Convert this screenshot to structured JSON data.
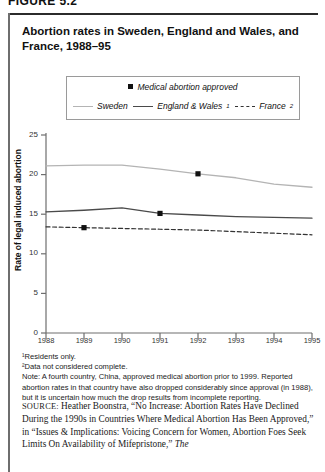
{
  "figure_tag": "FIGURE 5.2",
  "title": "Abortion rates in Sweden, England and Wales, and France, 1988–95",
  "legend": {
    "marker_label": "Medical abortion approved",
    "sweden_label": "Sweden",
    "england_label": "England & Wales",
    "england_sup": "1",
    "france_label": "France",
    "france_sup": "2"
  },
  "footnotes": {
    "fn1": "¹Residents only.",
    "fn2": "²Data not considered complete.",
    "note": "Note: A fourth country, China, approved medical abortion prior to 1999. Reported abortion rates in that country have also dropped considerably since approval (in 1988), but it is uncertain how much the drop results from incomplete reporting."
  },
  "source": {
    "label": "SOURCE:",
    "text": "Heather Boonstra, “No Increase: Abortion Rates Have Declined During the 1990s in Countries Where Medical Abortion Has Been Approved,” in “Issues & Implications: Voicing Concern for Women, Abortion Foes Seek Limits On Availability of Mifepristone,” ",
    "italic_tail": "The"
  },
  "colors": {
    "sweden": "#b4b4b4",
    "england": "#4a4a4a",
    "france": "#333333",
    "marker": "#111111",
    "axis": "#6e6e6e"
  },
  "chart_data": {
    "type": "line",
    "title": "Abortion rates in Sweden, England and Wales, and France, 1988–95",
    "xlabel": "",
    "ylabel": "Rate of legal induced abortion",
    "x": [
      1988,
      1989,
      1990,
      1991,
      1992,
      1993,
      1994,
      1995
    ],
    "categories": [
      "1988",
      "1989",
      "1990",
      "1991",
      "1992",
      "1993",
      "1994",
      "1995"
    ],
    "xlim": [
      1988,
      1995
    ],
    "ylim": [
      0,
      25
    ],
    "yticks": [
      0,
      5,
      10,
      15,
      20,
      25
    ],
    "grid": false,
    "legend_position": "top",
    "series": [
      {
        "name": "Sweden",
        "style": "solid",
        "color": "#b4b4b4",
        "values": [
          21.1,
          21.2,
          21.2,
          20.7,
          20.1,
          19.6,
          18.8,
          18.4
        ]
      },
      {
        "name": "England & Wales",
        "style": "solid",
        "color": "#4a4a4a",
        "values": [
          15.3,
          15.5,
          15.8,
          15.1,
          14.9,
          14.7,
          14.6,
          14.5
        ]
      },
      {
        "name": "France",
        "style": "dashed",
        "color": "#333333",
        "values": [
          13.4,
          13.3,
          13.2,
          13.1,
          13.0,
          12.8,
          12.6,
          12.4
        ]
      }
    ],
    "annotations": [
      {
        "label": "Medical abortion approved",
        "series": "France",
        "x": 1989,
        "y": 13.3
      },
      {
        "label": "Medical abortion approved",
        "series": "England & Wales",
        "x": 1991,
        "y": 15.1
      },
      {
        "label": "Medical abortion approved",
        "series": "Sweden",
        "x": 1992,
        "y": 20.1
      }
    ]
  }
}
